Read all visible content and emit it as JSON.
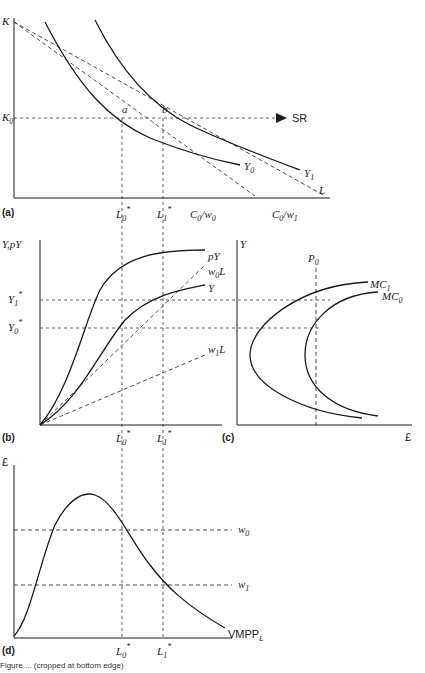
{
  "figure": {
    "caption": "Figure ... (cropped at bottom edge)",
    "panels": [
      {
        "id": "a",
        "label": "(a)",
        "axes": {
          "y": "K",
          "x": "L"
        },
        "y_ticks": [
          {
            "text": "K",
            "sub": "0"
          }
        ],
        "x_ticks": [
          {
            "text": "L",
            "sub": "0",
            "sup": "*"
          },
          {
            "text": "L",
            "sub": "1",
            "sup": "*"
          },
          {
            "text": "C",
            "sub": "0",
            "suffix": "/w",
            "suffix_sub": "0"
          },
          {
            "text": "C",
            "sub": "0",
            "suffix": "/w",
            "suffix_sub": "1"
          }
        ],
        "curves": [
          {
            "name": "Y",
            "sub": "0"
          },
          {
            "name": "Y",
            "sub": "1"
          }
        ],
        "points": [
          "a",
          "b"
        ],
        "arrow_label": "SR"
      },
      {
        "id": "b",
        "label": "(b)",
        "axes": {
          "y": "Y,pY",
          "x": ""
        },
        "y_ticks": [
          {
            "text": "Y",
            "sub": "1",
            "sup": "*"
          },
          {
            "text": "Y",
            "sub": "0",
            "sup": "*"
          }
        ],
        "x_ticks": [
          {
            "text": "L",
            "sub": "0",
            "sup": "*"
          },
          {
            "text": "L",
            "sub": "1",
            "sup": "*"
          }
        ],
        "curves": [
          {
            "name": "pY"
          },
          {
            "name": "w",
            "sub": "0",
            "suffix": "L"
          },
          {
            "name": "Y"
          },
          {
            "name": "w",
            "sub": "1",
            "suffix": "L"
          }
        ]
      },
      {
        "id": "c",
        "label": "(c)",
        "axes": {
          "y": "Y",
          "x": "£"
        },
        "top_label": {
          "text": "P",
          "sub": "0"
        },
        "curves": [
          {
            "name": "MC",
            "sub": "1"
          },
          {
            "name": "MC",
            "sub": "0"
          }
        ]
      },
      {
        "id": "d",
        "label": "(d)",
        "axes": {
          "y": "£",
          "x": ""
        },
        "x_ticks": [
          {
            "text": "L",
            "sub": "0",
            "sup": "*"
          },
          {
            "text": "L",
            "sub": "1",
            "sup": "*"
          }
        ],
        "levels": [
          {
            "text": "w",
            "sub": "0"
          },
          {
            "text": "w",
            "sub": "1"
          }
        ],
        "curves": [
          {
            "name": "VMPP",
            "sub": "L"
          }
        ]
      }
    ]
  }
}
